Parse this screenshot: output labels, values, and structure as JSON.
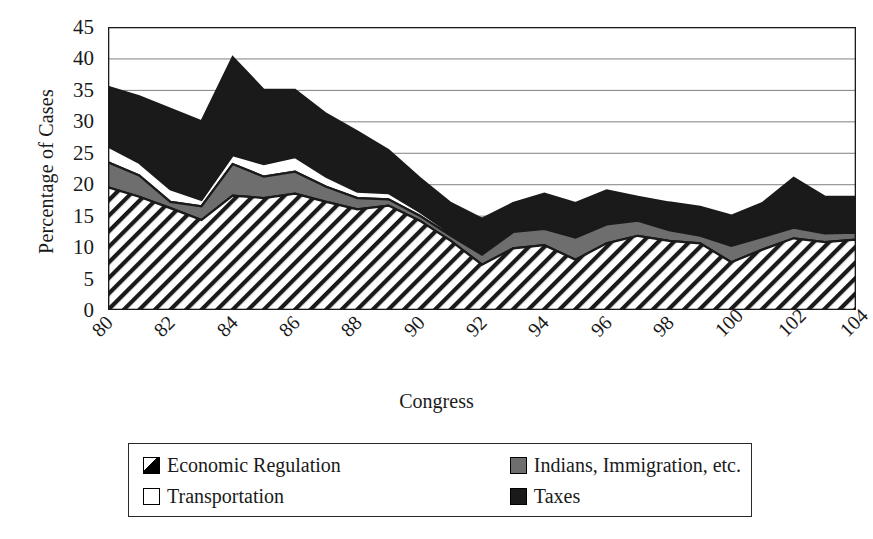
{
  "chart_data": {
    "type": "area",
    "stacked": true,
    "title": "",
    "xlabel": "Congress",
    "ylabel": "Percentage of Cases",
    "ylim": [
      0,
      45
    ],
    "ytick_step": 5,
    "yticks": [
      0,
      5,
      10,
      15,
      20,
      25,
      30,
      35,
      40,
      45
    ],
    "ytick_labels": [
      "0",
      "5",
      "10",
      "15",
      "20",
      "25",
      "30",
      "35",
      "40",
      "45"
    ],
    "grid": "horizontal",
    "legend_position": "below",
    "x": [
      80,
      81,
      82,
      83,
      84,
      85,
      86,
      87,
      88,
      89,
      90,
      91,
      92,
      93,
      94,
      95,
      96,
      97,
      98,
      99,
      100,
      101,
      102,
      103,
      104
    ],
    "xtick_labels": [
      "80",
      "82",
      "84",
      "86",
      "88",
      "90",
      "92",
      "94",
      "96",
      "98",
      "100",
      "102",
      "104"
    ],
    "xtick_label_values": [
      80,
      82,
      84,
      86,
      88,
      90,
      92,
      94,
      96,
      98,
      100,
      102,
      104
    ],
    "xtick_rotation": -45,
    "series": [
      {
        "name": "Economic Regulation",
        "fill": "hatch-diagonal",
        "color": "#ffffff",
        "values": [
          19.5,
          18.0,
          16.2,
          14.3,
          18.2,
          17.8,
          18.5,
          17.2,
          16.0,
          16.6,
          14.2,
          11.0,
          7.2,
          9.8,
          10.3,
          8.0,
          10.6,
          11.8,
          11.0,
          10.6,
          7.6,
          9.6,
          11.4,
          10.8,
          11.2
        ]
      },
      {
        "name": "Indians, Immigration, etc.",
        "fill": "solid",
        "color": "#6e6e6e",
        "values": [
          4.0,
          3.4,
          1.0,
          2.2,
          5.0,
          3.4,
          3.5,
          2.4,
          1.8,
          1.0,
          0.8,
          0.8,
          1.6,
          2.6,
          2.6,
          3.5,
          3.0,
          2.4,
          1.7,
          1.2,
          2.6,
          2.0,
          1.7,
          1.4,
          1.1
        ]
      },
      {
        "name": "Transportation",
        "fill": "solid",
        "color": "#ffffff",
        "values": [
          2.5,
          2.0,
          2.0,
          1.0,
          1.4,
          2.0,
          2.3,
          1.6,
          1.0,
          1.0,
          0.6,
          0.4,
          0.2,
          0.2,
          0.2,
          0.2,
          0.2,
          0.2,
          0.2,
          0.2,
          0.2,
          0.2,
          0.2,
          0.2,
          0.2
        ]
      },
      {
        "name": "Taxes",
        "fill": "solid",
        "color": "#1a1a1a",
        "values": [
          9.5,
          10.6,
          12.8,
          12.5,
          15.6,
          11.8,
          10.7,
          10.0,
          9.6,
          6.8,
          5.4,
          4.8,
          5.5,
          4.4,
          5.4,
          5.3,
          5.2,
          3.6,
          4.2,
          4.4,
          4.6,
          5.2,
          7.7,
          5.6,
          5.5
        ]
      }
    ],
    "series_totals": [
      35.5,
      34.0,
      32.0,
      30.0,
      40.2,
      35.0,
      35.0,
      31.2,
      28.4,
      25.4,
      21.0,
      17.0,
      14.5,
      17.0,
      18.5,
      17.0,
      19.0,
      18.0,
      17.1,
      16.4,
      15.0,
      17.0,
      21.0,
      18.0,
      18.0
    ]
  },
  "axes": {
    "y_title": "Percentage of Cases",
    "x_title": "Congress"
  },
  "legend": {
    "entries": [
      {
        "label": "Economic Regulation",
        "swatch": "hatch-swatch"
      },
      {
        "label": "Indians, Immigration, etc.",
        "swatch": "gray-swatch"
      },
      {
        "label": "Transportation",
        "swatch": "white-swatch"
      },
      {
        "label": "Taxes",
        "swatch": "black-swatch"
      }
    ]
  },
  "style": {
    "axis_color": "#1a1a1a",
    "grid_color": "#808080",
    "background": "#ffffff"
  }
}
